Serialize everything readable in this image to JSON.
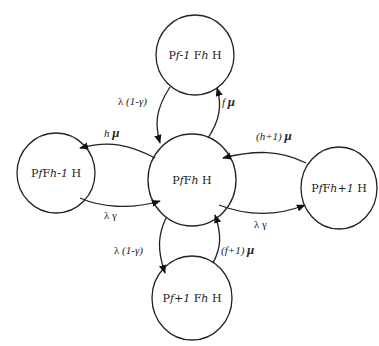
{
  "diagram": {
    "type": "state-transition",
    "nodes": [
      {
        "id": "top",
        "label_parts": [
          "P",
          "f-1",
          " F",
          "h",
          " H"
        ],
        "label": "Pf-1 Fh H"
      },
      {
        "id": "left",
        "label_parts": [
          "P",
          "f",
          "F",
          "h-1",
          " H"
        ],
        "label": "PfFh-1 H"
      },
      {
        "id": "center",
        "label_parts": [
          "P",
          "f",
          "F",
          "h",
          " H"
        ],
        "label": "PfFh H"
      },
      {
        "id": "right",
        "label_parts": [
          "P",
          "f",
          "F",
          "h+1",
          " H"
        ],
        "label": "PfFh+1 H"
      },
      {
        "id": "bottom",
        "label_parts": [
          "P",
          "f+1",
          " F",
          "h",
          " H"
        ],
        "label": "Pf+1 Fh H"
      }
    ],
    "edges": [
      {
        "from": "top",
        "to": "center",
        "label": "λ (1-γ)",
        "parts": [
          "λ ",
          "(1-γ)"
        ]
      },
      {
        "from": "center",
        "to": "top",
        "label": "f μ",
        "parts": [
          "f ",
          "μ"
        ]
      },
      {
        "from": "center",
        "to": "left",
        "label": "h μ",
        "parts": [
          "h ",
          "μ"
        ]
      },
      {
        "from": "left",
        "to": "center",
        "label": "λ γ",
        "parts": [
          "λ γ"
        ]
      },
      {
        "from": "right",
        "to": "center",
        "label": "(h+1) μ",
        "parts": [
          "(h+1) ",
          "μ"
        ]
      },
      {
        "from": "center",
        "to": "right",
        "label": "λ γ",
        "parts": [
          "λ γ"
        ]
      },
      {
        "from": "center",
        "to": "bottom",
        "label": "λ (1-γ)",
        "parts": [
          "λ ",
          "(1-γ)"
        ]
      },
      {
        "from": "bottom",
        "to": "center",
        "label": "(f+1) μ",
        "parts": [
          "(f+1) ",
          "μ"
        ]
      }
    ]
  }
}
